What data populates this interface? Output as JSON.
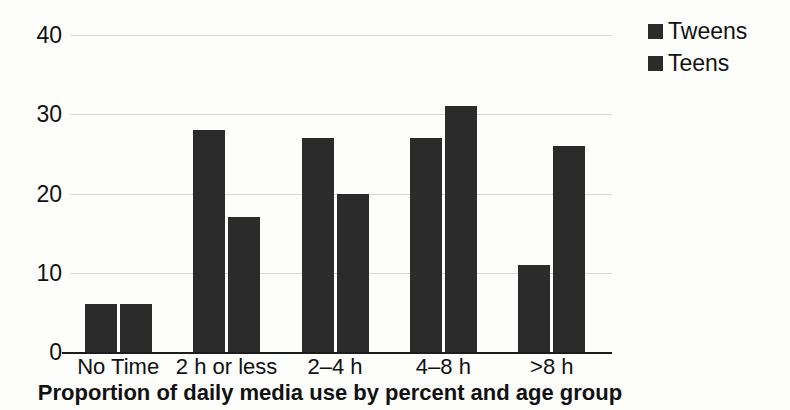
{
  "chart_data": {
    "type": "bar",
    "title": "Proportion of daily media use by percent and age group",
    "xlabel": "",
    "ylabel": "",
    "ylim": [
      0,
      40
    ],
    "yticks": [
      0,
      10,
      20,
      30,
      40
    ],
    "grid": true,
    "legend_position": "top-right",
    "categories": [
      "No Time",
      "2 h or less",
      "2–4 h",
      "4–8 h",
      ">8 h"
    ],
    "series": [
      {
        "name": "Tweens",
        "color": "#2b2b2b",
        "values": [
          6,
          28,
          27,
          27,
          11
        ]
      },
      {
        "name": "Teens",
        "color": "#2b2b2b",
        "values": [
          6,
          17,
          20,
          31,
          26
        ]
      }
    ]
  },
  "axis": {
    "y_tick_labels": [
      "40",
      "30",
      "20",
      "10",
      "0"
    ]
  },
  "legend": {
    "items": [
      {
        "label": "Tweens"
      },
      {
        "label": "Teens"
      }
    ]
  },
  "colors": {
    "bar": "#2b2b2b",
    "gridline": "#d8d8d6",
    "axis": "#1d1d1d",
    "background": "#fdfdfb",
    "text": "#111111"
  }
}
